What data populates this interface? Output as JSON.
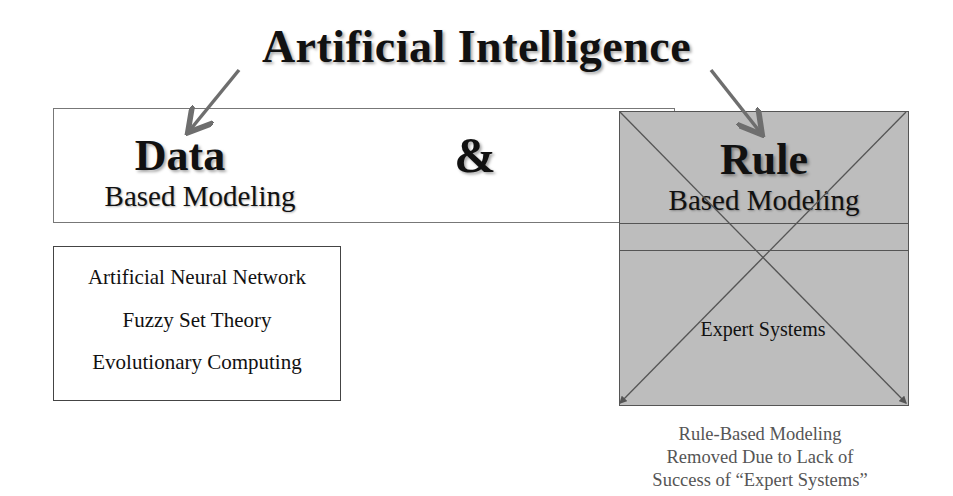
{
  "title": "Artificial Intelligence",
  "conjunction": "&",
  "data_branch": {
    "heading": "Data",
    "subheading": "Based Modeling",
    "items": [
      "Artificial Neural Network",
      "Fuzzy Set Theory",
      "Evolutionary Computing"
    ]
  },
  "rule_branch": {
    "heading": "Rule",
    "subheading": "Based Modeling",
    "items": [
      "Expert Systems"
    ],
    "status": "crossed-out",
    "fill_color": "#bdbdbd"
  },
  "caption": {
    "lines": [
      "Rule-Based Modeling",
      "Removed Due to Lack of",
      "Success of “Expert Systems”"
    ]
  },
  "colors": {
    "arrow": "#6e6e6e",
    "line": "#555555",
    "text": "#111111",
    "caption": "#555555"
  }
}
